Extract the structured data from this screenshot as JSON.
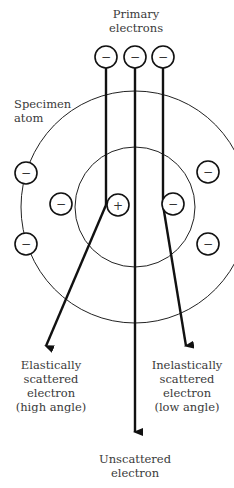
{
  "labels": {
    "primary": [
      "Primary",
      "electrons"
    ],
    "specimen": [
      "Specimen",
      "atom"
    ],
    "elastic": [
      "Elastically",
      "scattered",
      "electron",
      "(high angle)"
    ],
    "inelastic": [
      "Inelastically",
      "scattered",
      "electron",
      "(low angle)"
    ],
    "unscattered": [
      "Unscattered",
      "electron"
    ]
  },
  "symbols": {
    "electron": "−",
    "nucleus": "+"
  },
  "colors": {
    "ink": "#111111",
    "text": "#3a3a3a",
    "background": "#ffffff"
  }
}
